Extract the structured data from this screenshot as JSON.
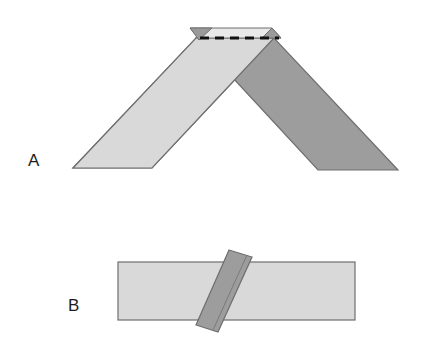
{
  "figure": {
    "background_color": "#ffffff"
  },
  "colors": {
    "background": "#ffffff",
    "light_band": "#d9d9d9",
    "light_band_alt": "#dcdcdc",
    "dark_band": "#9d9d9d",
    "top_flap": "#e9e9e9",
    "tip_triangle": "#9a9a9a",
    "outline": "#6e6e6e",
    "fold_line": "#111111",
    "label_text": "#1c1c1c"
  },
  "panels": [
    {
      "id": "A",
      "label": "A",
      "label_position": {
        "x": 28,
        "y": 166
      },
      "description": "Chevron / tent-shaped folded strip with dashed fold line at the apex",
      "elements": [
        {
          "name": "left-band",
          "kind": "parallelogram",
          "fill": "#d9d9d9",
          "points": "73,168 152,168 274,38 196,38"
        },
        {
          "name": "right-band",
          "kind": "parallelogram",
          "fill": "#9d9d9d",
          "points": "318,170 398,170 274,38 196,38"
        },
        {
          "name": "top-flap",
          "kind": "quadrilateral",
          "fill": "#e9e9e9",
          "points": "190,28 272,28 281,38 199,38"
        },
        {
          "name": "left-tip-triangle",
          "kind": "triangle",
          "fill": "#9a9a9a",
          "points": "190,28 212,28 199,40"
        },
        {
          "name": "right-tip-triangle",
          "kind": "triangle",
          "fill": "#9a9a9a",
          "points": "272,28 281,38 262,38"
        },
        {
          "name": "apex-fold-line",
          "kind": "dashed-line",
          "stroke": "#111111",
          "x1": 200,
          "y1": 38,
          "x2": 279,
          "y2": 38,
          "dash": "9 6",
          "width": 3
        }
      ]
    },
    {
      "id": "B",
      "label": "B",
      "label_position": {
        "x": 68,
        "y": 311
      },
      "description": "Flat horizontal strip crossed by a rotated darker strip with a crease line",
      "elements": [
        {
          "name": "horizontal-strip",
          "kind": "rectangle",
          "fill": "#d9d9d9",
          "x": 118,
          "y": 262,
          "width": 237,
          "height": 58
        },
        {
          "name": "rotated-strip",
          "kind": "parallelogram",
          "fill": "#9d9d9d",
          "points": "229,250 252,257 218,332 196,325"
        },
        {
          "name": "rotated-strip-crease",
          "kind": "line",
          "stroke": "#7a7a7a",
          "x1": 247,
          "y1": 255,
          "x2": 213,
          "y2": 330,
          "width": 1
        }
      ]
    }
  ]
}
